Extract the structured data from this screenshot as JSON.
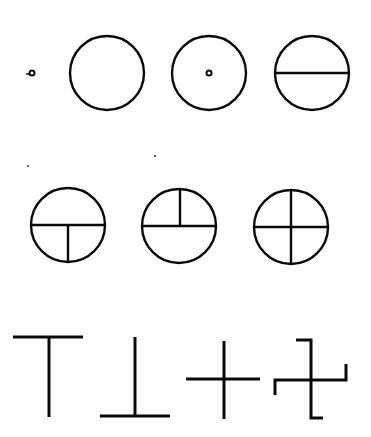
{
  "diagram": {
    "ink_color": "#0a0a0a",
    "background": "#ffffff",
    "rows": [
      {
        "name": "row-1",
        "figures": [
          {
            "name": "small-dot",
            "type": "dot",
            "cx": 32,
            "cy": 73,
            "r": 3
          },
          {
            "name": "empty-circle",
            "type": "circle",
            "cx": 107,
            "cy": 73,
            "r": 37
          },
          {
            "name": "circle-with-center-dot",
            "type": "circle-dot",
            "cx": 209,
            "cy": 73,
            "r": 37,
            "dot_r": 3
          },
          {
            "name": "circle-with-horizontal-line",
            "type": "circle-h",
            "cx": 312,
            "cy": 73,
            "r": 37
          }
        ]
      },
      {
        "name": "row-2",
        "figures": [
          {
            "name": "circle-horizontal-and-lower-vertical",
            "type": "circle-h-down",
            "cx": 68,
            "cy": 225,
            "r": 37
          },
          {
            "name": "circle-horizontal-and-upper-vertical",
            "type": "circle-h-up",
            "cx": 179,
            "cy": 226,
            "r": 37
          },
          {
            "name": "circle-with-cross",
            "type": "circle-cross",
            "cx": 291,
            "cy": 227,
            "r": 37
          }
        ]
      },
      {
        "name": "row-3",
        "figures": [
          {
            "name": "t-shape",
            "type": "tee"
          },
          {
            "name": "inverted-t-shape",
            "type": "inverted-tee"
          },
          {
            "name": "plus-cross",
            "type": "plus"
          },
          {
            "name": "hooked-cross",
            "type": "hooked-cross"
          }
        ]
      }
    ]
  }
}
